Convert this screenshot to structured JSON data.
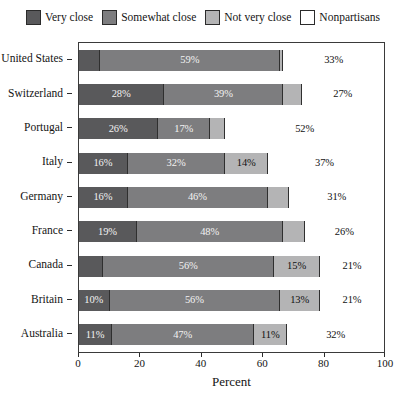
{
  "chart_data": {
    "type": "bar",
    "orientation": "horizontal",
    "stacked": true,
    "title": "",
    "xlabel": "Percent",
    "ylabel": "",
    "xlim": [
      0,
      100
    ],
    "xticks": [
      0,
      20,
      40,
      60,
      80,
      100
    ],
    "grid": false,
    "legend_position": "top",
    "categories": [
      "United States",
      "Switzerland",
      "Portugal",
      "Italy",
      "Germany",
      "France",
      "Canada",
      "Britain",
      "Australia"
    ],
    "series": [
      {
        "name": "Very close",
        "color": "#59595b",
        "values": [
          7,
          28,
          26,
          16,
          16,
          19,
          8,
          10,
          11
        ],
        "labels": [
          "",
          "28%",
          "26%",
          "16%",
          "16%",
          "19%",
          "",
          "10%",
          "11%"
        ]
      },
      {
        "name": "Somewhat close",
        "color": "#7d7d7f",
        "values": [
          59,
          39,
          17,
          32,
          46,
          48,
          56,
          56,
          47
        ],
        "labels": [
          "59%",
          "39%",
          "17%",
          "32%",
          "46%",
          "48%",
          "56%",
          "56%",
          "47%"
        ]
      },
      {
        "name": "Not very close",
        "color": "#b4b4b5",
        "values": [
          1,
          6,
          5,
          14,
          7,
          7,
          15,
          13,
          11
        ],
        "labels": [
          "",
          "",
          "",
          "14%",
          "",
          "",
          "15%",
          "13%",
          "11%"
        ]
      },
      {
        "name": "Nonpartisans",
        "color": "#ffffff",
        "values": [
          33,
          27,
          52,
          37,
          31,
          26,
          21,
          21,
          32
        ],
        "labels": [
          "33%",
          "27%",
          "52%",
          "37%",
          "31%",
          "26%",
          "21%",
          "21%",
          "32%"
        ]
      }
    ]
  },
  "legend": {
    "items": [
      {
        "label": "Very close",
        "color": "#59595b"
      },
      {
        "label": "Somewhat close",
        "color": "#7d7d7f"
      },
      {
        "label": "Not very close",
        "color": "#b4b4b5"
      },
      {
        "label": "Nonpartisans",
        "color": "#ffffff"
      }
    ]
  },
  "axis": {
    "x_title": "Percent",
    "x_tick_labels": [
      "0",
      "20",
      "40",
      "60",
      "80",
      "100"
    ],
    "y_tick_labels": [
      "United States",
      "Switzerland",
      "Portugal",
      "Italy",
      "Germany",
      "France",
      "Canada",
      "Britain",
      "Australia"
    ]
  }
}
